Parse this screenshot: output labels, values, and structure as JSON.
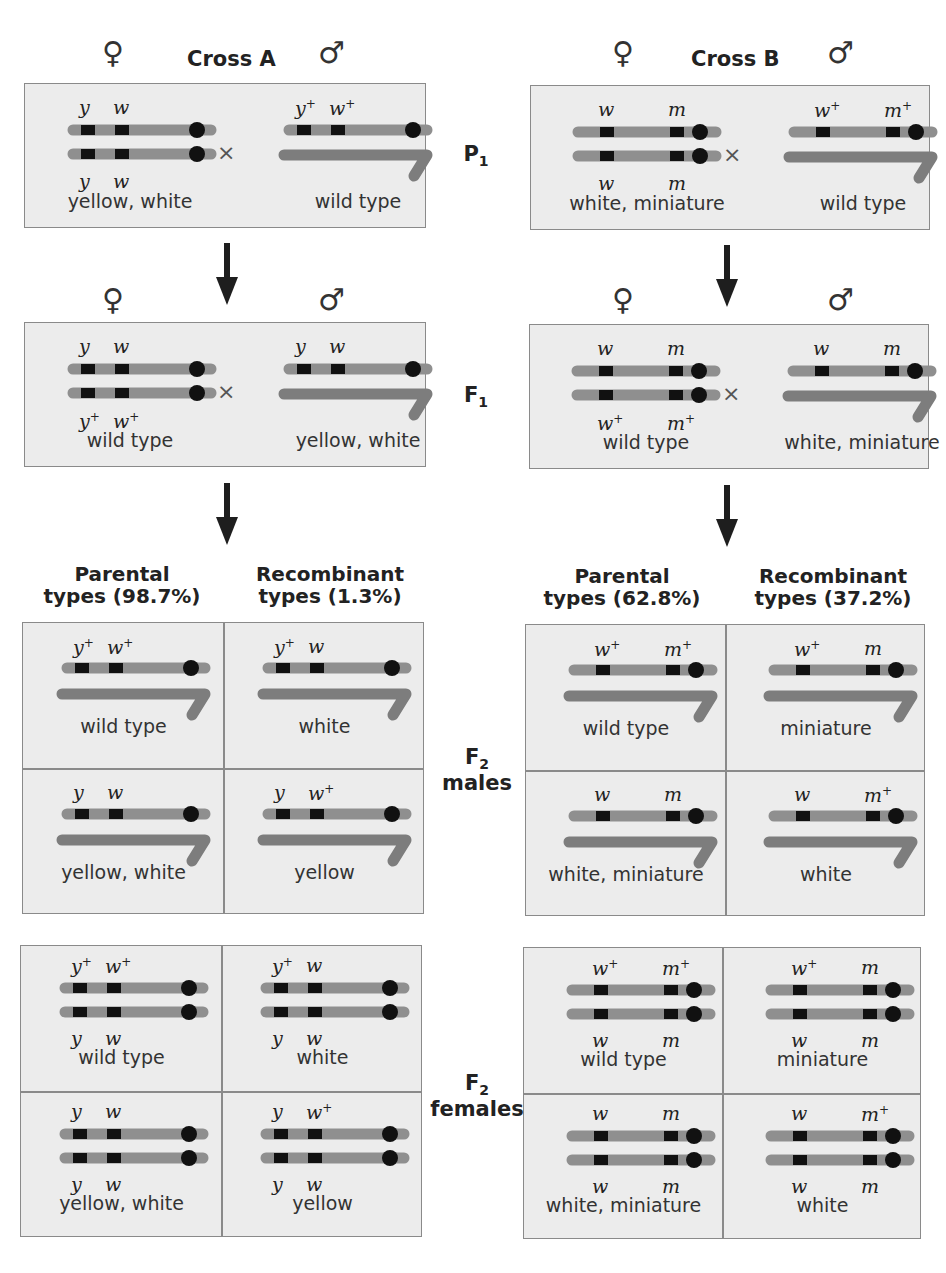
{
  "figure": {
    "colors": {
      "chromosome": "#8f8f8f",
      "y_chromosome": "#7d7d7d",
      "gene_band": "#111111",
      "centromere": "#111111",
      "panel_bg": "#ececec",
      "panel_border": "#8a8a8a"
    },
    "symbols": {
      "female": "♀",
      "male": "♂",
      "cross": "×"
    },
    "generations": {
      "p1": {
        "label": "P",
        "sub": "1"
      },
      "f1": {
        "label": "F",
        "sub": "1"
      },
      "f2_males": {
        "label": "F",
        "sub": "2",
        "line2": "males"
      },
      "f2_females": {
        "label": "F",
        "sub": "2",
        "line2": "females"
      }
    },
    "crossA": {
      "title": "Cross A",
      "p1": {
        "female": {
          "top": [
            "y",
            "w"
          ],
          "bottom": [
            "y",
            "w"
          ],
          "phenotype": "yellow, white"
        },
        "male": {
          "top": [
            "y+",
            "w+"
          ],
          "phenotype": "wild type"
        }
      },
      "f1": {
        "female": {
          "top": [
            "y",
            "w"
          ],
          "bottom": [
            "y+",
            "w+"
          ],
          "phenotype": "wild type"
        },
        "male": {
          "top": [
            "y",
            "w"
          ],
          "phenotype": "yellow, white"
        }
      },
      "f2_headers": {
        "parental": {
          "line1": "Parental",
          "line2": "types (98.7%)"
        },
        "recombinant": {
          "line1": "Recombinant",
          "line2": "types (1.3%)"
        }
      },
      "f2_males": [
        {
          "alleles": [
            "y+",
            "w+"
          ],
          "phenotype": "wild type"
        },
        {
          "alleles": [
            "y+",
            "w"
          ],
          "phenotype": "white"
        },
        {
          "alleles": [
            "y",
            "w"
          ],
          "phenotype": "yellow, white"
        },
        {
          "alleles": [
            "y",
            "w+"
          ],
          "phenotype": "yellow"
        }
      ],
      "f2_females": [
        {
          "top": [
            "y+",
            "w+"
          ],
          "bottom": [
            "y",
            "w"
          ],
          "phenotype": "wild type"
        },
        {
          "top": [
            "y+",
            "w"
          ],
          "bottom": [
            "y",
            "w"
          ],
          "phenotype": "white"
        },
        {
          "top": [
            "y",
            "w"
          ],
          "bottom": [
            "y",
            "w"
          ],
          "phenotype": "yellow, white"
        },
        {
          "top": [
            "y",
            "w+"
          ],
          "bottom": [
            "y",
            "w"
          ],
          "phenotype": "yellow"
        }
      ]
    },
    "crossB": {
      "title": "Cross B",
      "p1": {
        "female": {
          "top": [
            "w",
            "m"
          ],
          "bottom": [
            "w",
            "m"
          ],
          "phenotype": "white, miniature"
        },
        "male": {
          "top": [
            "w+",
            "m+"
          ],
          "phenotype": "wild type"
        }
      },
      "f1": {
        "female": {
          "top": [
            "w",
            "m"
          ],
          "bottom": [
            "w+",
            "m+"
          ],
          "phenotype": "wild type"
        },
        "male": {
          "top": [
            "w",
            "m"
          ],
          "phenotype": "white, miniature"
        }
      },
      "f2_headers": {
        "parental": {
          "line1": "Parental",
          "line2": "types (62.8%)"
        },
        "recombinant": {
          "line1": "Recombinant",
          "line2": "types (37.2%)"
        }
      },
      "f2_males": [
        {
          "alleles": [
            "w+",
            "m+"
          ],
          "phenotype": "wild type"
        },
        {
          "alleles": [
            "w+",
            "m"
          ],
          "phenotype": "miniature"
        },
        {
          "alleles": [
            "w",
            "m"
          ],
          "phenotype": "white, miniature"
        },
        {
          "alleles": [
            "w",
            "m+"
          ],
          "phenotype": "white"
        }
      ],
      "f2_females": [
        {
          "top": [
            "w+",
            "m+"
          ],
          "bottom": [
            "w",
            "m"
          ],
          "phenotype": "wild type"
        },
        {
          "top": [
            "w+",
            "m"
          ],
          "bottom": [
            "w",
            "m"
          ],
          "phenotype": "miniature"
        },
        {
          "top": [
            "w",
            "m"
          ],
          "bottom": [
            "w",
            "m"
          ],
          "phenotype": "white, miniature"
        },
        {
          "top": [
            "w",
            "m+"
          ],
          "bottom": [
            "w",
            "m"
          ],
          "phenotype": "white"
        }
      ]
    }
  }
}
